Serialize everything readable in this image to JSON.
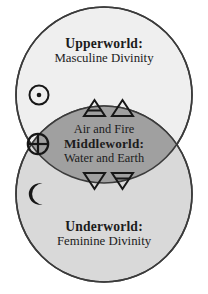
{
  "diagram": {
    "type": "venn-two-circle",
    "background_color": "#ffffff",
    "stroke_color": "#3b3b3b",
    "regions": [
      {
        "id": "upperworld",
        "title": "Upperworld:",
        "subtitle": "Masculine Divinity",
        "fill_color": "#efefef"
      },
      {
        "id": "middleworld",
        "title": "Middleworld:",
        "line_above": "Air and Fire",
        "line_below": "Water and Earth",
        "fill_color": "#a0a0a0"
      },
      {
        "id": "underworld",
        "title": "Underworld:",
        "subtitle": "Feminine Divinity",
        "fill_color": "#d9d9d9"
      }
    ],
    "symbols": [
      {
        "id": "sun",
        "name": "sun-symbol",
        "meaning": "Sun",
        "glyph": "☉"
      },
      {
        "id": "earth",
        "name": "earth-symbol",
        "meaning": "Earth",
        "glyph": "⊕"
      },
      {
        "id": "moon",
        "name": "moon-symbol",
        "meaning": "Moon",
        "glyph": "☽"
      },
      {
        "id": "air",
        "name": "air-symbol",
        "meaning": "Air",
        "glyph": "ὰ1"
      },
      {
        "id": "fire",
        "name": "fire-symbol",
        "meaning": "Fire",
        "glyph": "ὰ2"
      },
      {
        "id": "water",
        "name": "water-symbol",
        "meaning": "Water",
        "glyph": "ὰ4"
      },
      {
        "id": "earth_element",
        "name": "earth-element-symbol",
        "meaning": "Earth",
        "glyph": "ὰ3"
      }
    ]
  }
}
